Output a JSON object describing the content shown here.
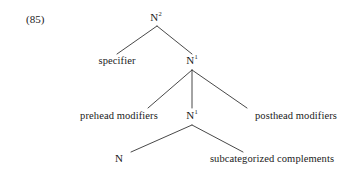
{
  "figure": {
    "example_number": "(85)",
    "type": "x-bar-syntax-tree",
    "background_color": "#ffffff",
    "line_color": "#333333",
    "text_color": "#1a1a1a"
  },
  "nodes": {
    "root": {
      "label": "N",
      "superscript": "2",
      "full_text": "N²",
      "x": 156,
      "y": 19,
      "level": 0
    },
    "nbar_upper": {
      "label": "N",
      "superscript": "1",
      "full_text": "N¹",
      "x": 192,
      "y": 62,
      "level": 1
    },
    "specifier": {
      "label": "specifier",
      "x": 117,
      "y": 62,
      "level": 1
    },
    "prehead_modifiers": {
      "label": "prehead modifiers",
      "x": 119,
      "y": 117,
      "level": 2
    },
    "nbar_lower": {
      "label": "N",
      "superscript": "1",
      "full_text": "N¹",
      "x": 192,
      "y": 117,
      "level": 2
    },
    "posthead_modifiers": {
      "label": "posthead modifiers",
      "x": 296,
      "y": 117,
      "level": 2
    },
    "head_noun": {
      "label": "N",
      "superscript": "",
      "full_text": "N",
      "x": 119,
      "y": 160,
      "level": 3
    },
    "subcategorized_complements": {
      "label": "subcategorized complements",
      "x": 272,
      "y": 160,
      "level": 3
    }
  },
  "branches": [
    {
      "from": "root",
      "to": "specifier",
      "x1": 157,
      "y1": 26,
      "x2": 117,
      "y2": 54
    },
    {
      "from": "root",
      "to": "nbar_upper",
      "x1": 157,
      "y1": 26,
      "x2": 192,
      "y2": 54
    },
    {
      "from": "nbar_upper",
      "to": "prehead_modifiers",
      "x1": 192,
      "y1": 70,
      "x2": 148,
      "y2": 108
    },
    {
      "from": "nbar_upper",
      "to": "nbar_lower",
      "x1": 192,
      "y1": 70,
      "x2": 192,
      "y2": 108
    },
    {
      "from": "nbar_upper",
      "to": "posthead_modifiers",
      "x1": 192,
      "y1": 70,
      "x2": 247,
      "y2": 108
    },
    {
      "from": "nbar_lower",
      "to": "head_noun",
      "x1": 192,
      "y1": 125,
      "x2": 131,
      "y2": 152
    },
    {
      "from": "nbar_lower",
      "to": "subcategorized_complements",
      "x1": 192,
      "y1": 125,
      "x2": 243,
      "y2": 152
    }
  ]
}
